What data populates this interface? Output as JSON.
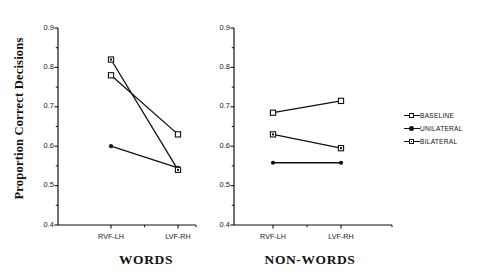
{
  "figure": {
    "ylabel": "Proportion Correct Decisions",
    "y_ticks": [
      "0.9",
      "0.8",
      "0.7",
      "0.6",
      "0.5",
      "0.4"
    ],
    "x_ticks": [
      "RVF-LH",
      "LVF-RH"
    ],
    "panels": [
      {
        "title": "WORDS"
      },
      {
        "title": "NON-WORDS"
      }
    ],
    "legend": [
      {
        "label": "BASELINE",
        "marker": "open-square"
      },
      {
        "label": "UNILATERAL",
        "marker": "filled-dot"
      },
      {
        "label": "BILATERAL",
        "marker": "open-square-dot"
      }
    ]
  },
  "chart_data": {
    "type": "line",
    "title": "",
    "xlabel": "",
    "ylabel": "Proportion Correct Decisions",
    "ylim": [
      0.4,
      0.9
    ],
    "ytick_values": [
      0.4,
      0.5,
      0.6,
      0.7,
      0.8,
      0.9
    ],
    "yminor_tick_values": [
      0.45,
      0.55,
      0.65,
      0.75,
      0.85
    ],
    "grid": false,
    "legend_position": "right",
    "panels": [
      {
        "name": "WORDS",
        "categories": [
          "RVF-LH",
          "LVF-RH"
        ],
        "series": [
          {
            "name": "BASELINE",
            "marker": "open-square",
            "values": [
              0.78,
              0.63
            ]
          },
          {
            "name": "UNILATERAL",
            "marker": "filled-dot",
            "values": [
              0.6,
              0.545
            ]
          },
          {
            "name": "BILATERAL",
            "marker": "open-square-dot",
            "values": [
              0.82,
              0.54
            ]
          }
        ]
      },
      {
        "name": "NON-WORDS",
        "categories": [
          "RVF-LH",
          "LVF-RH"
        ],
        "series": [
          {
            "name": "BASELINE",
            "marker": "open-square",
            "values": [
              0.685,
              0.715
            ]
          },
          {
            "name": "UNILATERAL",
            "marker": "filled-dot",
            "values": [
              0.558,
              0.558
            ]
          },
          {
            "name": "BILATERAL",
            "marker": "open-square-dot",
            "values": [
              0.63,
              0.595
            ]
          }
        ]
      }
    ]
  },
  "colors": {
    "ink": "#111111",
    "background": "#ffffff"
  }
}
